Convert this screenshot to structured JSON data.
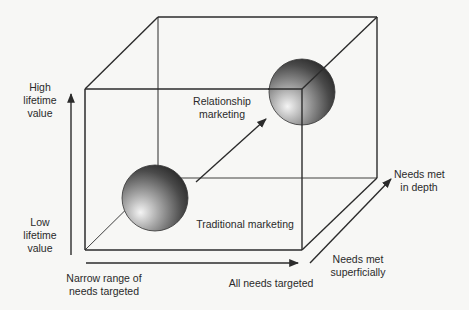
{
  "diagram": {
    "type": "3d-cube-matrix",
    "colors": {
      "line": "#2b2b2b",
      "background": "#f7f7f5",
      "sphere_dark": "#3a3a3a",
      "sphere_light": "#f2f2f2"
    },
    "y_axis": {
      "high_label_line1": "High",
      "high_label_line2": "lifetime",
      "high_label_line3": "value",
      "low_label_line1": "Low",
      "low_label_line2": "lifetime",
      "low_label_line3": "value"
    },
    "x_axis": {
      "left_label_line1": "Narrow range of",
      "left_label_line2": "needs targeted",
      "right_label": "All needs targeted"
    },
    "z_axis": {
      "near_label_line1": "Needs met",
      "near_label_line2": "superficially",
      "far_label_line1": "Needs met",
      "far_label_line2": "in depth"
    },
    "nodes": [
      {
        "id": "traditional",
        "label": "Traditional marketing"
      },
      {
        "id": "relationship",
        "label_line1": "Relationship",
        "label_line2": "marketing"
      }
    ]
  }
}
